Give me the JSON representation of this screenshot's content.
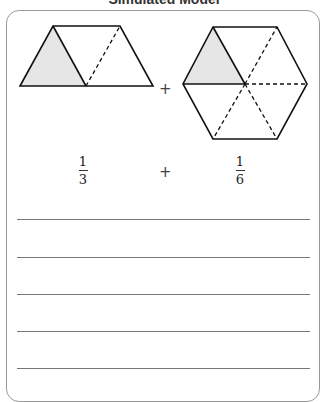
{
  "header": {
    "title": "Simulated Model"
  },
  "model": {
    "left_shape": {
      "type": "trapezoid",
      "parts": 3,
      "shaded": 1
    },
    "right_shape": {
      "type": "hexagon",
      "parts": 6,
      "shaded": 1
    },
    "operator": "+",
    "shade_color": "#e6e6e6"
  },
  "expression": {
    "fraction1": {
      "numerator": "1",
      "denominator": "3"
    },
    "operator": "+",
    "fraction2": {
      "numerator": "1",
      "denominator": "6"
    }
  },
  "answer_lines": {
    "count": 5
  }
}
